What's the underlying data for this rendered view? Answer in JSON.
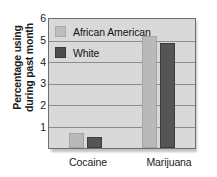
{
  "chart_data": {
    "type": "bar",
    "title": "",
    "xlabel": "",
    "ylabel": "Percentage using during past month",
    "ylabel_line1": "Percentage using",
    "ylabel_line2": "during past month",
    "categories": [
      "Cocaine",
      "Marijuana"
    ],
    "series": [
      {
        "name": "African American",
        "values": [
          0.7,
          5.2
        ],
        "color": "#b9b9b9"
      },
      {
        "name": "White",
        "values": [
          0.5,
          4.9
        ],
        "color": "#555555"
      }
    ],
    "ylim": [
      0,
      6
    ],
    "yticks": [
      6,
      5,
      4,
      3,
      2,
      1
    ],
    "grid": true,
    "legend_position": "top-left"
  },
  "legend": {
    "items": [
      {
        "label": "African American",
        "swatch": "legend-swatch-african-american"
      },
      {
        "label": "White",
        "swatch": "legend-swatch-white"
      }
    ]
  },
  "axes": {
    "y_title_line1": "Percentage using",
    "y_title_line2": "during past month",
    "y_tick_6": "6",
    "y_tick_5": "5",
    "y_tick_4": "4",
    "y_tick_3": "3",
    "y_tick_2": "2",
    "y_tick_1": "1"
  },
  "xaxis": {
    "cat_0": "Cocaine",
    "cat_1": "Marijuana"
  }
}
